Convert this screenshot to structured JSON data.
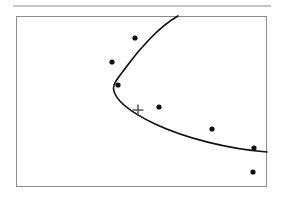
{
  "figure": {
    "title": "",
    "caption": "",
    "width": 283,
    "height": 202,
    "background_color": "#ffffff"
  },
  "top_rule": {
    "name": "horizontal-rule",
    "x1": 13,
    "y1": 6,
    "x2": 271,
    "y2": 6,
    "color": "#8a8a8a",
    "thickness": 1.2
  },
  "plot_frame": {
    "name": "plot-border",
    "x": 16,
    "y": 16,
    "width": 251,
    "height": 171,
    "border_color": "#8c8c8c",
    "border_width": 1,
    "fill": "#ffffff"
  },
  "chart_data": {
    "type": "scatter",
    "title": "",
    "subtitle": "",
    "xlabel": "",
    "ylabel": "",
    "grid": false,
    "legend": null,
    "axis_ticks": [],
    "tick_labels": [],
    "xlim": [
      16,
      267
    ],
    "ylim": [
      16,
      187
    ],
    "note": "Axes are unlabeled; values are given in figure pixel coordinates with y increasing downward.",
    "series": [
      {
        "name": "data-points",
        "type": "scatter",
        "marker": "filled-circle",
        "color": "#111111",
        "marker_radius": 2.6,
        "points": [
          {
            "label": "p1",
            "x": 135,
            "y": 38
          },
          {
            "label": "p2",
            "x": 112,
            "y": 62
          },
          {
            "label": "p3",
            "x": 118,
            "y": 85
          },
          {
            "label": "p4",
            "x": 159,
            "y": 107
          },
          {
            "label": "p5",
            "x": 212,
            "y": 129
          },
          {
            "label": "p6",
            "x": 254,
            "y": 148
          },
          {
            "label": "p7",
            "x": 253,
            "y": 172
          }
        ]
      },
      {
        "name": "fitted-curve",
        "type": "line",
        "color": "#111111",
        "line_width": 1.7,
        "description": "Sideways parabola opening to the right; leftmost vertex near (113, 78); upper branch exits the top border near x=178; lower branch exits the right border near y=152.",
        "path": "M 178 16 C 160 26 140 48 127 66 C 119 77 113 83 113.5 89 C 115 101 132 113 155 124 C 185 138 228 149 267 152",
        "vertex": {
          "x": 113,
          "y": 78
        },
        "exit_top": {
          "x": 178,
          "y": 16
        },
        "exit_right": {
          "x": 267,
          "y": 152
        }
      },
      {
        "name": "cross-marker",
        "type": "marker",
        "marker": "plus",
        "color": "#4a4a4a",
        "size": 11,
        "line_width": 1.4,
        "points": [
          {
            "label": "reference-point",
            "x": 138,
            "y": 110
          }
        ]
      }
    ]
  }
}
